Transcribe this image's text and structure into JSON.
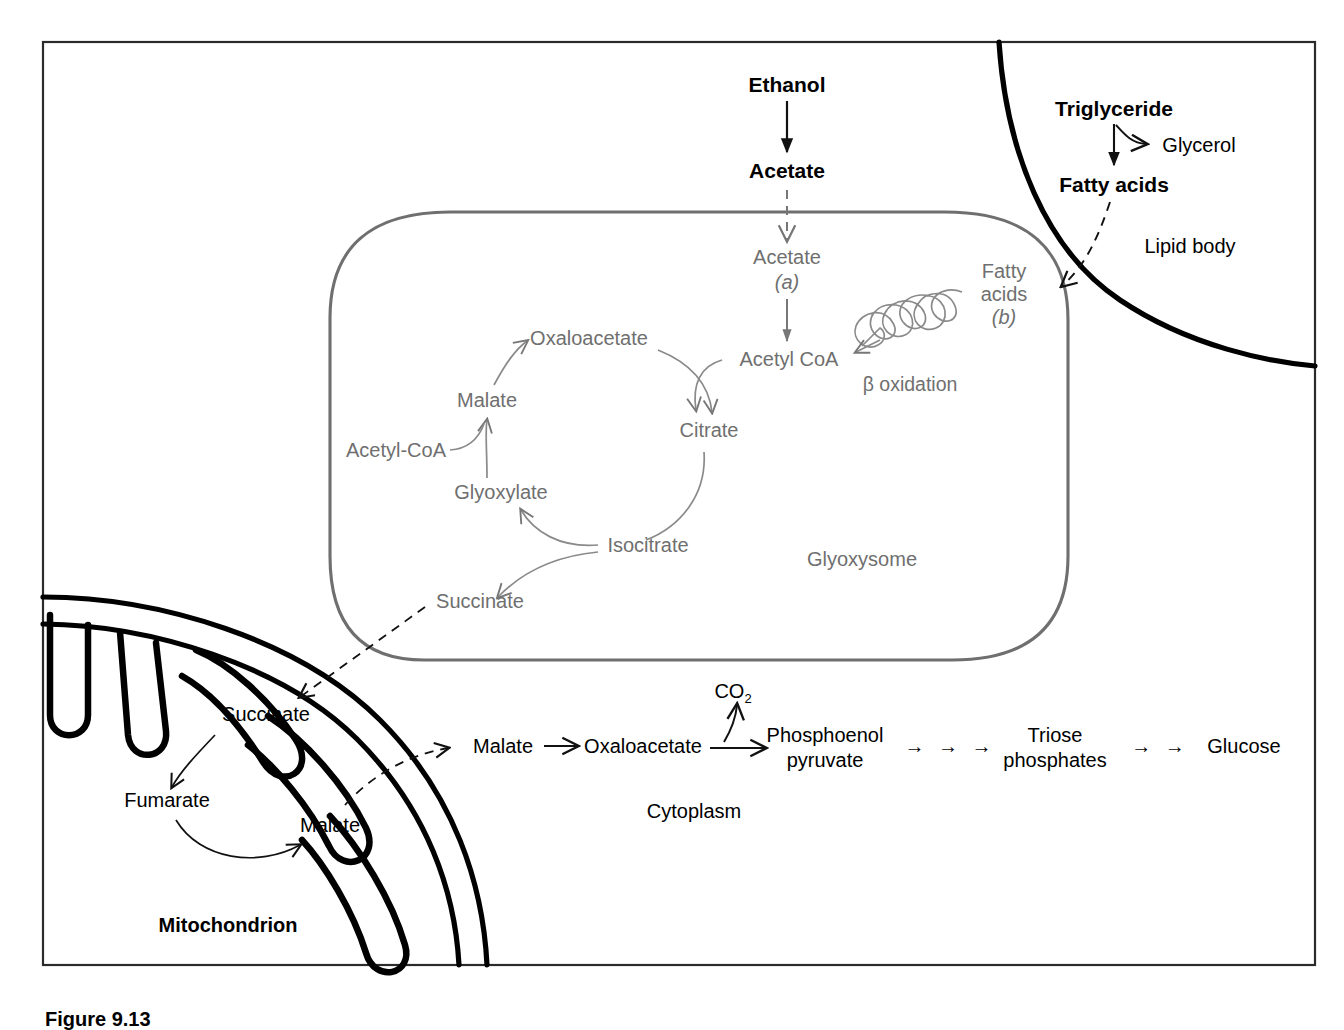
{
  "figure": {
    "caption": "Figure 9.13",
    "frame_color": "#2b2b2b",
    "glyoxysome_color": "#6f6f6f",
    "membrane_color": "#000000"
  },
  "compartments": {
    "glyoxysome_label": "Glyoxysome",
    "lipid_body_label": "Lipid body",
    "mitochondrion_label": "Mitochondrion",
    "cytoplasm_label": "Cytoplasm"
  },
  "cytosol_top": {
    "ethanol": "Ethanol",
    "acetate": "Acetate",
    "triglyceride": "Triglyceride",
    "glycerol": "Glycerol",
    "fatty_acids": "Fatty acids"
  },
  "glyoxysome": {
    "acetate": "Acetate",
    "acetate_tag": "(a)",
    "fatty_acids_line1": "Fatty",
    "fatty_acids_line2": "acids",
    "fatty_acids_tag": "(b)",
    "acetyl_coa": "Acetyl CoA",
    "beta_oxidation": "β oxidation",
    "citrate": "Citrate",
    "isocitrate": "Isocitrate",
    "oxaloacetate": "Oxaloacetate",
    "malate": "Malate",
    "glyoxylate": "Glyoxylate",
    "acetyl_coa_cycle": "Acetyl-CoA",
    "succinate": "Succinate"
  },
  "mitochondrion": {
    "succinate": "Succinate",
    "fumarate": "Fumarate",
    "malate": "Malate"
  },
  "cytoplasm_chain": {
    "malate": "Malate",
    "oxaloacetate": "Oxaloacetate",
    "co2": "CO",
    "co2_sub": "2",
    "pep_line1": "Phosphoenol",
    "pep_line2": "pyruvate",
    "arrows_1": "→ → →",
    "triose_line1": "Triose",
    "triose_line2": "phosphates",
    "arrows_2": "→ →",
    "glucose": "Glucose"
  }
}
